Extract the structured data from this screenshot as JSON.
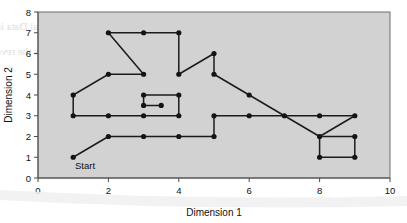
{
  "figure": {
    "annotations": [
      {
        "name": "start-label",
        "text": "Start",
        "x": 1.05,
        "y": 0.45
      }
    ]
  },
  "chart_data": {
    "type": "line",
    "title": "",
    "xlabel": "Dimension 1",
    "ylabel": "Dimension 2",
    "xlim": [
      0,
      10
    ],
    "ylim": [
      0,
      8
    ],
    "xticks": [
      0,
      2,
      4,
      6,
      8,
      10
    ],
    "yticks": [
      0,
      1,
      2,
      3,
      4,
      5,
      6,
      7,
      8
    ],
    "xtick_labels": [
      "0",
      "2",
      "4",
      "6",
      "8",
      "10"
    ],
    "ytick_labels": [
      "0",
      "1",
      "2",
      "3",
      "4",
      "5",
      "6",
      "7",
      "8"
    ],
    "grid": false,
    "legend": "none",
    "plot_background": "#d2d2d2",
    "series_color": "#141414",
    "marker": "filled-circle",
    "series": [
      {
        "name": "Route path",
        "segments": [
          {
            "name": "start-ramp",
            "points": [
              [
                1,
                1
              ],
              [
                2,
                2
              ]
            ]
          },
          {
            "name": "lower-corridor",
            "points": [
              [
                2,
                2
              ],
              [
                3,
                2
              ],
              [
                4,
                2
              ],
              [
                5,
                2
              ]
            ]
          },
          {
            "name": "lower-to-mid-riser",
            "points": [
              [
                5,
                2
              ],
              [
                5,
                3
              ]
            ]
          },
          {
            "name": "mid-corridor-right",
            "points": [
              [
                5,
                3
              ],
              [
                6,
                3
              ],
              [
                7,
                3
              ],
              [
                8,
                3
              ],
              [
                9,
                3
              ]
            ]
          },
          {
            "name": "mid-corridor-left",
            "points": [
              [
                1,
                3
              ],
              [
                2,
                3
              ],
              [
                3,
                3
              ],
              [
                4,
                3
              ]
            ]
          },
          {
            "name": "left-riser",
            "points": [
              [
                1,
                3
              ],
              [
                1,
                4
              ]
            ]
          },
          {
            "name": "left-ascent",
            "points": [
              [
                1,
                4
              ],
              [
                2,
                5
              ],
              [
                3,
                5
              ]
            ]
          },
          {
            "name": "upper-descent",
            "points": [
              [
                2,
                7
              ],
              [
                3,
                5
              ]
            ]
          },
          {
            "name": "top-corridor",
            "points": [
              [
                2,
                7
              ],
              [
                3,
                7
              ],
              [
                4,
                7
              ]
            ]
          },
          {
            "name": "top-right-riser",
            "points": [
              [
                4,
                7
              ],
              [
                4,
                5
              ]
            ]
          },
          {
            "name": "peak-ascent",
            "points": [
              [
                4,
                5
              ],
              [
                5,
                6
              ]
            ]
          },
          {
            "name": "peak-riser",
            "points": [
              [
                5,
                6
              ],
              [
                5,
                5
              ]
            ]
          },
          {
            "name": "long-descent",
            "points": [
              [
                5,
                5
              ],
              [
                6,
                4
              ],
              [
                7,
                3
              ],
              [
                8,
                2
              ]
            ]
          },
          {
            "name": "inner-box-top",
            "points": [
              [
                3,
                4
              ],
              [
                4,
                4
              ]
            ]
          },
          {
            "name": "inner-box-left-riser",
            "points": [
              [
                3,
                4
              ],
              [
                3,
                3.5
              ]
            ]
          },
          {
            "name": "inner-box-stub",
            "points": [
              [
                3,
                3.5
              ],
              [
                3.5,
                3.5
              ]
            ]
          },
          {
            "name": "inner-box-right-riser",
            "points": [
              [
                4,
                4
              ],
              [
                4,
                3
              ]
            ]
          },
          {
            "name": "end-box-top",
            "points": [
              [
                8,
                2
              ],
              [
                9,
                2
              ]
            ]
          },
          {
            "name": "end-box-left",
            "points": [
              [
                8,
                2
              ],
              [
                8,
                1
              ]
            ]
          },
          {
            "name": "end-box-bottom",
            "points": [
              [
                8,
                1
              ],
              [
                9,
                1
              ]
            ]
          },
          {
            "name": "end-box-right",
            "points": [
              [
                9,
                2
              ],
              [
                9,
                1
              ]
            ]
          },
          {
            "name": "end-box-to-mid",
            "points": [
              [
                8,
                2
              ],
              [
                9,
                3
              ]
            ]
          }
        ],
        "markers": [
          [
            1,
            1
          ],
          [
            2,
            2
          ],
          [
            3,
            2
          ],
          [
            4,
            2
          ],
          [
            5,
            2
          ],
          [
            1,
            3
          ],
          [
            2,
            3
          ],
          [
            3,
            3
          ],
          [
            4,
            3
          ],
          [
            5,
            3
          ],
          [
            6,
            3
          ],
          [
            7,
            3
          ],
          [
            8,
            3
          ],
          [
            9,
            3
          ],
          [
            1,
            4
          ],
          [
            2,
            5
          ],
          [
            3,
            5
          ],
          [
            2,
            7
          ],
          [
            3,
            7
          ],
          [
            4,
            7
          ],
          [
            4,
            5
          ],
          [
            5,
            6
          ],
          [
            5,
            5
          ],
          [
            6,
            4
          ],
          [
            3,
            4
          ],
          [
            4,
            4
          ],
          [
            3,
            3.5
          ],
          [
            3.5,
            3.5
          ],
          [
            8,
            2
          ],
          [
            9,
            2
          ],
          [
            8,
            1
          ],
          [
            9,
            1
          ]
        ]
      }
    ]
  }
}
